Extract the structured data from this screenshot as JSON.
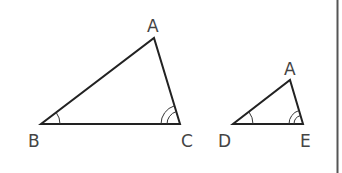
{
  "figure": {
    "triangles": [
      {
        "name": "large",
        "vertices": {
          "A": {
            "label": "A",
            "x": 154,
            "y": 38
          },
          "B": {
            "label": "B",
            "x": 41,
            "y": 124
          },
          "C": {
            "label": "C",
            "x": 180,
            "y": 124
          }
        },
        "angle_marks": {
          "B": 1,
          "C": 2
        }
      },
      {
        "name": "small",
        "vertices": {
          "A": {
            "label": "A",
            "x": 290,
            "y": 80
          },
          "D": {
            "label": "D",
            "x": 233,
            "y": 124
          },
          "E": {
            "label": "E",
            "x": 303,
            "y": 124
          }
        },
        "angle_marks": {
          "D": 1,
          "E": 2
        }
      }
    ],
    "labels": {
      "large_A": "A",
      "large_B": "B",
      "large_C": "C",
      "small_A": "A",
      "small_D": "D",
      "small_E": "E"
    },
    "colors": {
      "stroke": "#222222",
      "text": "#444444",
      "border": "#555555"
    }
  }
}
